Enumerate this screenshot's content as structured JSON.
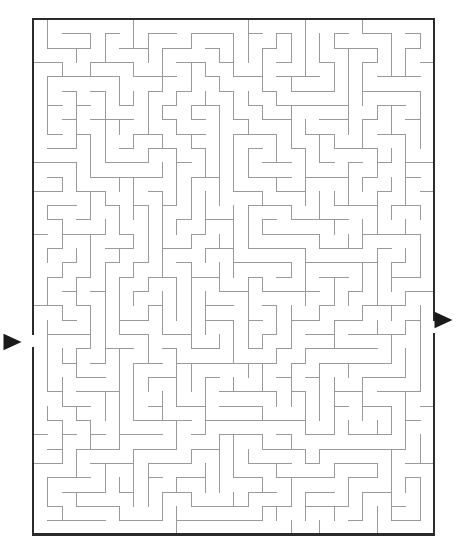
{
  "figure": {
    "kind": "maze-puzzle",
    "title": "",
    "background_color": "#ffffff"
  },
  "maze": {
    "columns": 28,
    "rows": 36,
    "cell_size": 14.32,
    "origin_x": 33,
    "origin_y": 19,
    "width_px": 401,
    "height_px": 514,
    "border_color": "#2b2b2b",
    "wall_color": "#9a9a9a",
    "border_thickness": 2.4,
    "wall_thickness": 1,
    "entry": {
      "label": "entry-arrow",
      "side": "left",
      "row": 22,
      "arrow_direction": "right",
      "arrow_x": 6,
      "arrow_y": 342,
      "arrow_size": 13
    },
    "exit": {
      "label": "exit-arrow",
      "side": "right",
      "row": 21,
      "arrow_direction": "right",
      "arrow_x": 437,
      "arrow_y": 320,
      "arrow_size": 13
    },
    "seed": 20240917,
    "algorithm": "recursive-backtracker",
    "perfect": true
  }
}
